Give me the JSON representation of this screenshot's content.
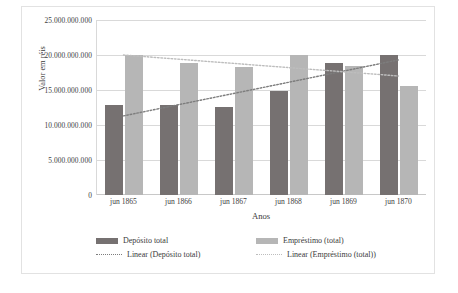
{
  "chart_data": {
    "type": "bar",
    "title": "",
    "xlabel": "Anos",
    "ylabel": "Valor em réis",
    "categories": [
      "jun 1865",
      "jun 1866",
      "jun 1867",
      "jun 1868",
      "jun 1869",
      "jun 1870"
    ],
    "ylim": [
      0,
      25000000000
    ],
    "ytick_labels": [
      "25.000.000.000",
      "20.000.000.000",
      "15.000.000.000",
      "10.000.000.000",
      "5.000.000.000",
      "0"
    ],
    "ytick_values": [
      25000000000,
      20000000000,
      15000000000,
      10000000000,
      5000000000,
      0
    ],
    "grid": true,
    "legend_position": "bottom",
    "series": [
      {
        "name": "Depósito total",
        "color": "#767171",
        "values": [
          12900000000,
          12800000000,
          12550000000,
          14900000000,
          18850000000,
          20000000000
        ]
      },
      {
        "name": "Empréstimo (total)",
        "color": "#b6b6b6",
        "values": [
          20000000000,
          18900000000,
          18300000000,
          20000000000,
          18400000000,
          15600000000
        ]
      }
    ],
    "trendlines": [
      {
        "name": "Linear (Depósito total)",
        "color": "#7d7d7d",
        "style": "dotted",
        "start_value": 11300000000,
        "end_value": 19300000000
      },
      {
        "name": "Linear (Empréstimo (total))",
        "color": "#bdbdbd",
        "style": "dotted",
        "start_value": 20000000000,
        "end_value": 17000000000
      }
    ]
  },
  "legend": {
    "items": [
      {
        "label": "Depósito total",
        "marker": "swatch-dark"
      },
      {
        "label": "Empréstimo (total)",
        "marker": "swatch-light"
      },
      {
        "label": "Linear (Depósito total)",
        "marker": "dotted-dark"
      },
      {
        "label": "Linear (Empréstimo (total))",
        "marker": "dotted-light"
      }
    ]
  }
}
